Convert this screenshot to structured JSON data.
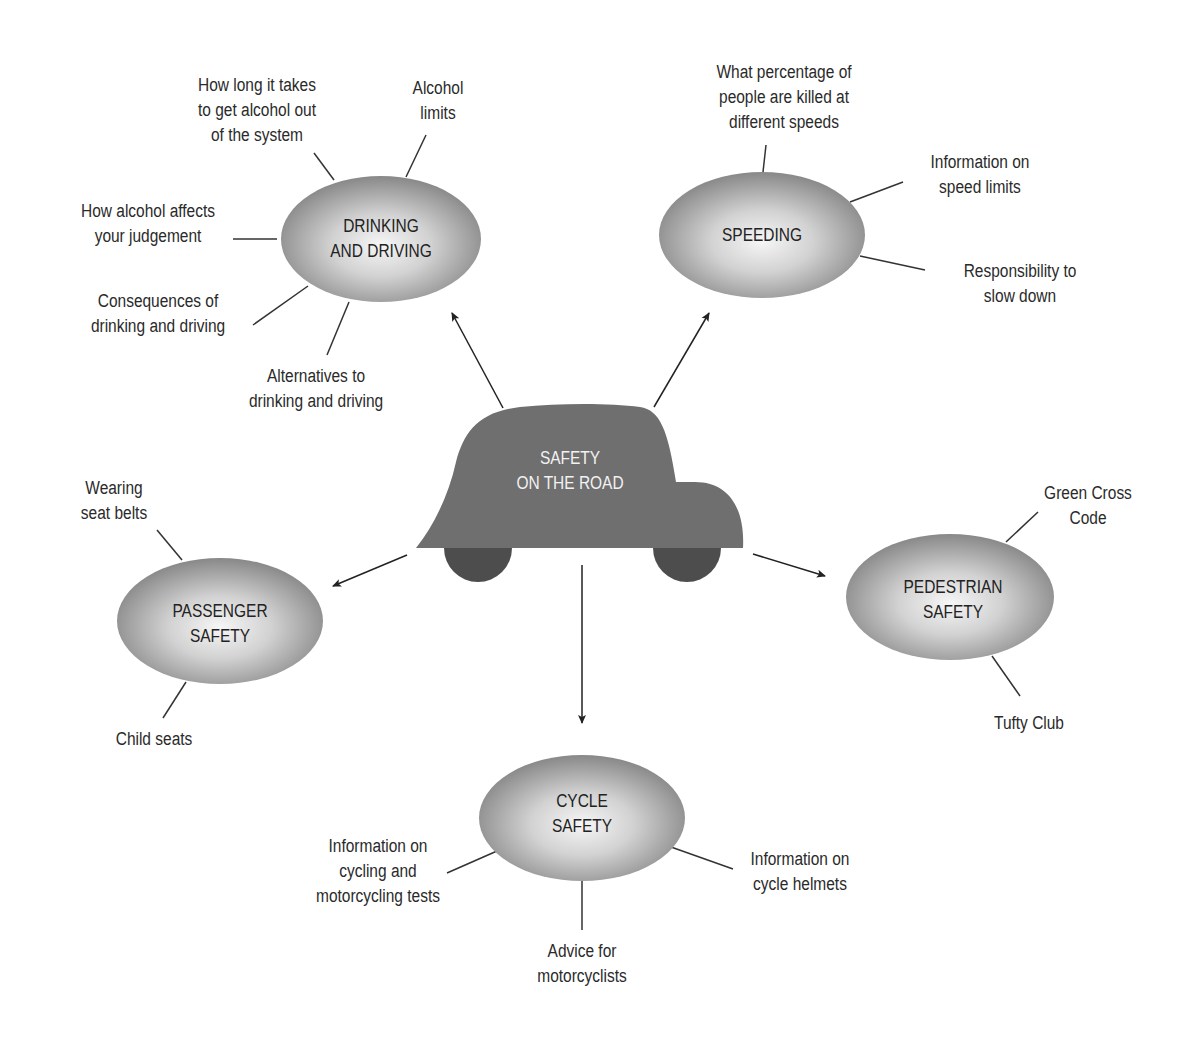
{
  "diagram": {
    "center": {
      "id": "safety-on-the-road",
      "shape": "car",
      "lines": [
        "SAFETY",
        "ON THE ROAD"
      ],
      "fill": "#6f6f6f",
      "wheel_fill": "#4a4a4a",
      "text_color": "#f2f2f2"
    },
    "nodes": [
      {
        "id": "drinking-and-driving",
        "lines": [
          "DRINKING",
          "AND DRIVING"
        ],
        "subtopics": [
          {
            "lines": [
              "How long it takes",
              "to get alcohol out",
              "of the system"
            ]
          },
          {
            "lines": [
              "Alcohol",
              "limits"
            ]
          },
          {
            "lines": [
              "How alcohol affects",
              "your judgement"
            ]
          },
          {
            "lines": [
              "Consequences of",
              "drinking and driving"
            ]
          },
          {
            "lines": [
              "Alternatives to",
              "drinking and driving"
            ]
          }
        ]
      },
      {
        "id": "speeding",
        "lines": [
          "SPEEDING"
        ],
        "subtopics": [
          {
            "lines": [
              "What percentage of",
              "people are killed at",
              "different speeds"
            ]
          },
          {
            "lines": [
              "Information on",
              "speed limits"
            ]
          },
          {
            "lines": [
              "Responsibility to",
              "slow down"
            ]
          }
        ]
      },
      {
        "id": "passenger-safety",
        "lines": [
          "PASSENGER",
          "SAFETY"
        ],
        "subtopics": [
          {
            "lines": [
              "Wearing",
              "seat belts"
            ]
          },
          {
            "lines": [
              "Child seats"
            ]
          }
        ]
      },
      {
        "id": "pedestrian-safety",
        "lines": [
          "PEDESTRIAN",
          "SAFETY"
        ],
        "subtopics": [
          {
            "lines": [
              "Green Cross",
              "Code"
            ]
          },
          {
            "lines": [
              "Tufty Club"
            ]
          }
        ]
      },
      {
        "id": "cycle-safety",
        "lines": [
          "CYCLE",
          "SAFETY"
        ],
        "subtopics": [
          {
            "lines": [
              "Information on",
              "cycling and",
              "motorcycling tests"
            ]
          },
          {
            "lines": [
              "Advice for",
              "motorcyclists"
            ]
          },
          {
            "lines": [
              "Information on",
              "cycle helmets"
            ]
          }
        ]
      }
    ],
    "colors": {
      "ellipse_center": "#f4f4f4",
      "ellipse_edge": "#8c8c8c",
      "line": "#333333",
      "text": "#2a2a2a"
    }
  }
}
